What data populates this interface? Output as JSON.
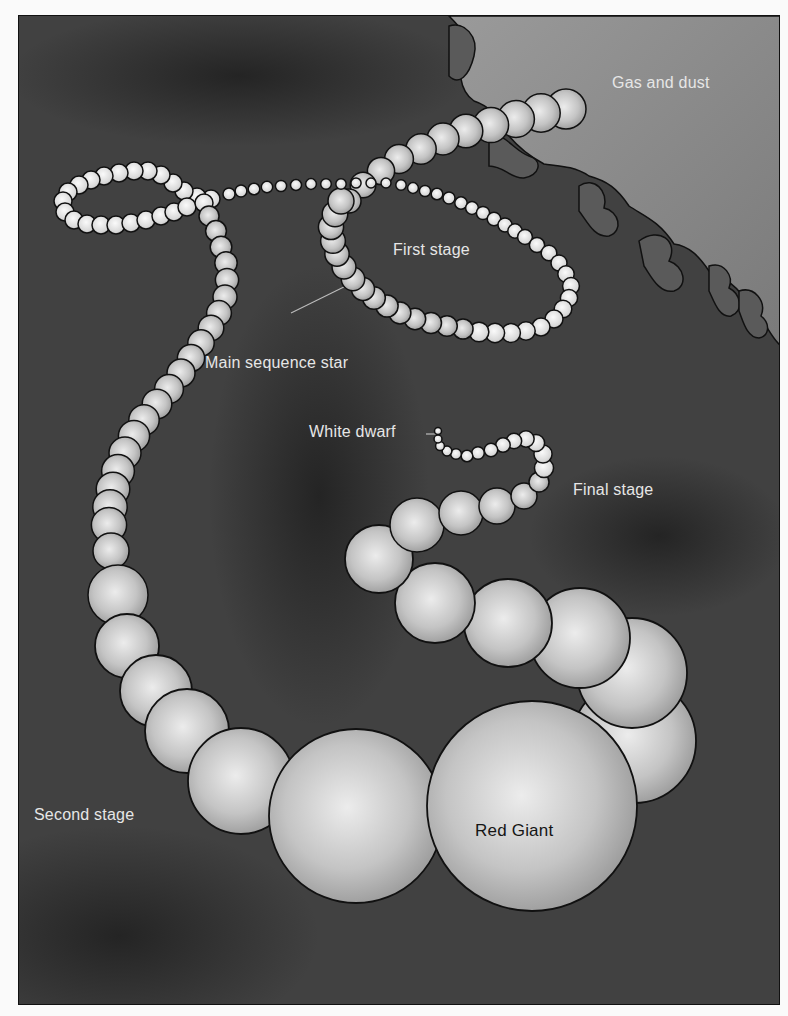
{
  "diagram": {
    "labels": {
      "gas_and_dust": "Gas and dust",
      "first_stage": "First stage",
      "main_sequence_star": "Main sequence star",
      "white_dwarf": "White dwarf",
      "final_stage": "Final stage",
      "second_stage": "Second stage",
      "red_giant": "Red Giant"
    },
    "stages": [
      {
        "name": "Gas and dust",
        "order": 0
      },
      {
        "name": "First stage",
        "order": 1,
        "object": "Main sequence star"
      },
      {
        "name": "Second stage",
        "order": 2,
        "object": "Red Giant"
      },
      {
        "name": "Final stage",
        "order": 3,
        "object": "White dwarf"
      }
    ],
    "colors": {
      "background": "#3e3e3e",
      "nebula": "#8c8c8c",
      "bead_light": "#e8e8e8",
      "bead_dark": "#9a9a9a",
      "outline": "#111111",
      "label": "#e6e6e6"
    }
  }
}
